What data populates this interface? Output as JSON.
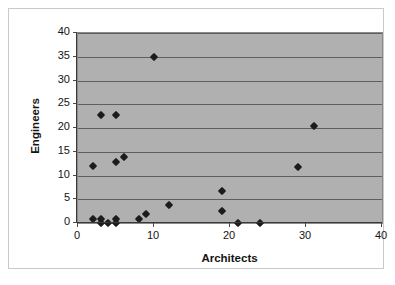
{
  "chart_data": {
    "type": "scatter",
    "title": "",
    "xlabel": "Architects",
    "ylabel": "Engineers",
    "xlim": [
      0,
      40
    ],
    "ylim": [
      0,
      40
    ],
    "xticks": [
      0,
      10,
      20,
      30,
      40
    ],
    "yticks": [
      0,
      5,
      10,
      15,
      20,
      25,
      30,
      35,
      40
    ],
    "xtick_labels": [
      "0",
      "10",
      "20",
      "30",
      "40"
    ],
    "ytick_labels": [
      "0",
      "5",
      "10",
      "15",
      "20",
      "25",
      "30",
      "35",
      "40"
    ],
    "grid": "horizontal",
    "legend": "none",
    "plot_background": "#b0b0b0",
    "marker_shape": "diamond",
    "marker_color": "#1c1c1c",
    "points": [
      {
        "x": 2,
        "y": 12.0
      },
      {
        "x": 2,
        "y": 0.9
      },
      {
        "x": 3,
        "y": 22.8
      },
      {
        "x": 3,
        "y": 0.9
      },
      {
        "x": 3,
        "y": 0.1
      },
      {
        "x": 4,
        "y": 0.1
      },
      {
        "x": 5,
        "y": 22.8
      },
      {
        "x": 5,
        "y": 12.8
      },
      {
        "x": 5,
        "y": 0.8
      },
      {
        "x": 5,
        "y": 0.1
      },
      {
        "x": 6,
        "y": 13.9
      },
      {
        "x": 8,
        "y": 0.9
      },
      {
        "x": 9,
        "y": 1.9
      },
      {
        "x": 10,
        "y": 34.9
      },
      {
        "x": 12,
        "y": 3.7
      },
      {
        "x": 19,
        "y": 6.7
      },
      {
        "x": 19,
        "y": 2.6
      },
      {
        "x": 21,
        "y": 0.0
      },
      {
        "x": 24,
        "y": 0.0
      },
      {
        "x": 29,
        "y": 11.7
      },
      {
        "x": 31,
        "y": 20.5
      }
    ]
  }
}
